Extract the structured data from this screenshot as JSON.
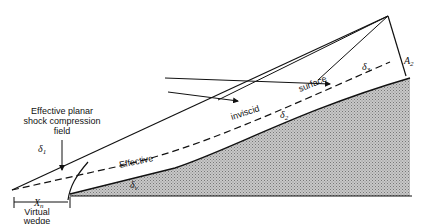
{
  "diagram": {
    "type": "compression-ramp-shock-diagram",
    "labels": {
      "shock_field": [
        "Effective planar",
        "shock compression",
        "field"
      ],
      "virtual_offset": [
        "Virtual",
        "wedge",
        "offset"
      ],
      "xn": "X",
      "xn_sub": "n",
      "surface_words": [
        "Effective",
        "inviscid",
        "surface"
      ],
      "delta1": "δ",
      "delta1_sub": "1",
      "delta2": "δ",
      "delta2_sub": "2",
      "delta3": "δ",
      "delta3_sub": "3",
      "delta_small": "δ",
      "delta_small_sub": "v",
      "a2": "A",
      "a2_sub": "2"
    },
    "colors": {
      "line": "#111111",
      "hatch_fill": "#a8a8a8",
      "background": "#ffffff"
    }
  }
}
